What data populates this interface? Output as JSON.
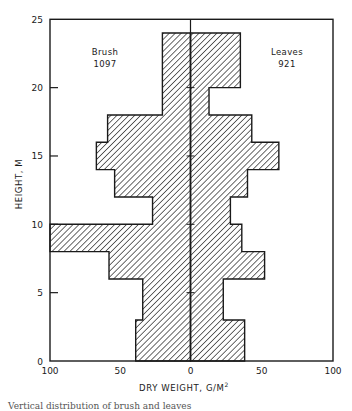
{
  "chart_data": {
    "type": "bar",
    "subtype": "back-to-back horizontal histogram (vertical profile)",
    "title": "",
    "xlabel": "DRY WEIGHT, G/M²",
    "ylabel": "HEIGHT, M",
    "xlim_left": [
      100,
      0
    ],
    "xlim_right": [
      0,
      100
    ],
    "ylim": [
      0,
      25
    ],
    "x_ticks": [
      "100",
      "50",
      "0",
      "50",
      "100"
    ],
    "y_ticks": [
      "0",
      "5",
      "10",
      "15",
      "20",
      "25"
    ],
    "grid": false,
    "legend": "inline labels",
    "series": [
      {
        "name": "Brush",
        "side": "left",
        "total": "1097",
        "segments": [
          {
            "from": 0,
            "to": 3,
            "value": 39
          },
          {
            "from": 3,
            "to": 6,
            "value": 34
          },
          {
            "from": 6,
            "to": 8,
            "value": 58
          },
          {
            "from": 8,
            "to": 10,
            "value": 100
          },
          {
            "from": 10,
            "to": 12,
            "value": 27
          },
          {
            "from": 12,
            "to": 14,
            "value": 54
          },
          {
            "from": 14,
            "to": 16,
            "value": 67
          },
          {
            "from": 16,
            "to": 18,
            "value": 59
          },
          {
            "from": 18,
            "to": 24,
            "value": 20
          }
        ]
      },
      {
        "name": "Leaves",
        "side": "right",
        "total": "921",
        "segments": [
          {
            "from": 0,
            "to": 3,
            "value": 38
          },
          {
            "from": 3,
            "to": 6,
            "value": 23
          },
          {
            "from": 6,
            "to": 8,
            "value": 52
          },
          {
            "from": 8,
            "to": 10,
            "value": 36
          },
          {
            "from": 10,
            "to": 12,
            "value": 28
          },
          {
            "from": 12,
            "to": 14,
            "value": 40
          },
          {
            "from": 14,
            "to": 16,
            "value": 62
          },
          {
            "from": 16,
            "to": 18,
            "value": 43
          },
          {
            "from": 18,
            "to": 20,
            "value": 13
          },
          {
            "from": 20,
            "to": 24,
            "value": 35
          }
        ]
      }
    ]
  },
  "labels": {
    "brush_name": "Brush",
    "brush_total": "1097",
    "leaves_name": "Leaves",
    "leaves_total": "921",
    "x_axis_title": "DRY WEIGHT, G/M",
    "x_axis_title_sup": "2",
    "y_axis_title": "HEIGHT, M",
    "caption": "Vertical distribution of brush and leaves"
  },
  "colors": {
    "ink": "#1a1a1a",
    "background": "#ffffff"
  }
}
